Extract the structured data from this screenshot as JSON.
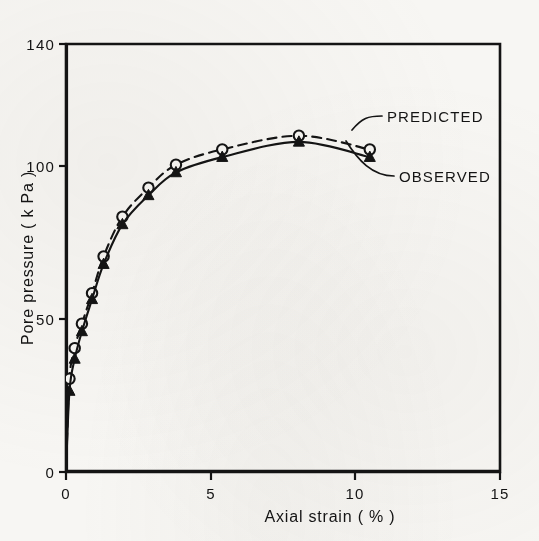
{
  "figure": {
    "background_color": "#f7f6f3",
    "ink_color": "#141414"
  },
  "chart_data": {
    "type": "line",
    "title": "",
    "xlabel": "Axial strain  ( % )",
    "ylabel": "Pore pressure   ( k Pa )",
    "xlim": [
      0,
      15
    ],
    "ylim": [
      0,
      140
    ],
    "xticks": [
      0,
      5,
      10,
      15
    ],
    "xtick_labels": [
      "0",
      "5",
      "10",
      "15"
    ],
    "yticks": [
      0,
      50,
      100,
      140
    ],
    "ytick_labels": [
      "0",
      "50",
      "100",
      "140"
    ],
    "grid": false,
    "legend_position": "inside-right",
    "series": [
      {
        "name": "PREDICTED",
        "line_style": "dashed",
        "marker": "open-circle",
        "x": [
          0.0,
          0.12,
          0.3,
          0.55,
          0.9,
          1.3,
          1.95,
          2.85,
          3.8,
          5.4,
          8.05,
          10.5
        ],
        "y": [
          0,
          30.5,
          40.5,
          48.5,
          58.5,
          70.5,
          83.5,
          93.0,
          100.5,
          105.5,
          110.0,
          105.5
        ]
      },
      {
        "name": "OBSERVED",
        "line_style": "solid",
        "marker": "filled-triangle",
        "x": [
          0.0,
          0.12,
          0.3,
          0.55,
          0.9,
          1.3,
          1.95,
          2.85,
          3.8,
          5.4,
          8.05,
          10.5
        ],
        "y": [
          0,
          26.5,
          37.0,
          46.0,
          56.5,
          68.0,
          81.0,
          90.5,
          98.0,
          103.0,
          108.0,
          103.0
        ]
      }
    ],
    "annotations": [
      {
        "text": "PREDICTED",
        "target_x": 10.5,
        "target_y": 105.5
      },
      {
        "text": "OBSERVED",
        "target_x": 10.5,
        "target_y": 103.0
      }
    ]
  },
  "labels": {
    "y_axis_title": "Pore pressure   ( k Pa )",
    "x_axis_title": "Axial strain  ( % )",
    "legend_predicted": "PREDICTED",
    "legend_observed": "OBSERVED",
    "ytick_140": "140",
    "ytick_100": "100",
    "ytick_50": "50",
    "ytick_0": "0",
    "xtick_0": "0",
    "xtick_5": "5",
    "xtick_10": "10",
    "xtick_15": "15"
  }
}
